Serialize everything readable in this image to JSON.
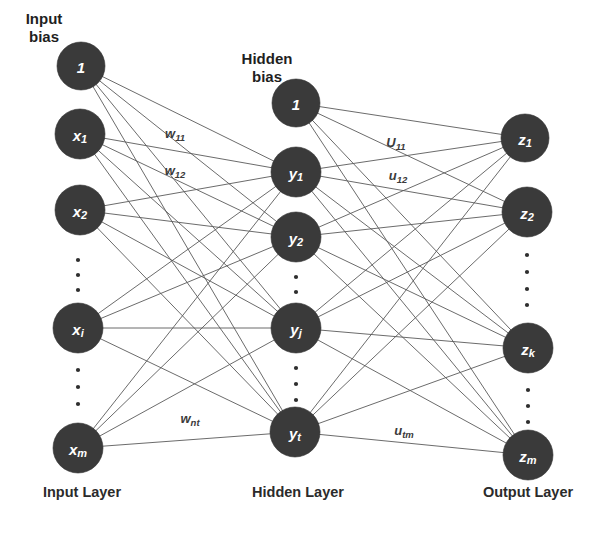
{
  "diagram": {
    "colors": {
      "node_fill": "#3a3a3a",
      "node_text": "#ffffff",
      "edge": "#5a5a5a",
      "label_text": "#2b2b2b",
      "background": "#ffffff"
    },
    "captions": {
      "input_bias": "Input\nbias",
      "input_bias_line1": "Input",
      "input_bias_line2": "bias",
      "hidden_bias_line1": "Hidden",
      "hidden_bias_line2": "bias",
      "input_layer": "Input Layer",
      "hidden_layer": "Hidden Layer",
      "output_layer": "Output Layer"
    },
    "layers": [
      {
        "id": "input",
        "name": "Input Layer",
        "x": 80,
        "nodes": [
          {
            "id": "input-bias",
            "base": "1",
            "sub": "",
            "cx": 81,
            "cy": 66,
            "r": 24,
            "font": 15,
            "is_bias": true
          },
          {
            "id": "input-x1",
            "base": "x",
            "sub": "1",
            "cx": 80,
            "cy": 134,
            "r": 25,
            "font": 15,
            "is_bias": false
          },
          {
            "id": "input-x2",
            "base": "x",
            "sub": "2",
            "cx": 80,
            "cy": 210,
            "r": 25,
            "font": 15,
            "is_bias": false
          },
          {
            "id": "input-xi",
            "base": "x",
            "sub": "i",
            "cx": 78,
            "cy": 328,
            "r": 25,
            "font": 15,
            "is_bias": false
          },
          {
            "id": "input-xm",
            "base": "x",
            "sub": "m",
            "cx": 78,
            "cy": 448,
            "r": 25,
            "font": 15,
            "is_bias": false
          }
        ],
        "ellipses": [
          {
            "cx": 78,
            "cy": 260
          },
          {
            "cx": 78,
            "cy": 275
          },
          {
            "cx": 78,
            "cy": 290
          },
          {
            "cx": 78,
            "cy": 370
          },
          {
            "cx": 78,
            "cy": 387
          },
          {
            "cx": 78,
            "cy": 404
          }
        ]
      },
      {
        "id": "hidden",
        "name": "Hidden Layer",
        "x": 296,
        "nodes": [
          {
            "id": "hidden-bias",
            "base": "1",
            "sub": "",
            "cx": 296,
            "cy": 103,
            "r": 24,
            "font": 15,
            "is_bias": true
          },
          {
            "id": "hidden-y1",
            "base": "y",
            "sub": "1",
            "cx": 296,
            "cy": 172,
            "r": 25,
            "font": 15,
            "is_bias": false
          },
          {
            "id": "hidden-y2",
            "base": "y",
            "sub": "2",
            "cx": 296,
            "cy": 237,
            "r": 25,
            "font": 15,
            "is_bias": false
          },
          {
            "id": "hidden-yj",
            "base": "y",
            "sub": "j",
            "cx": 296,
            "cy": 328,
            "r": 25,
            "font": 15,
            "is_bias": false
          },
          {
            "id": "hidden-yt",
            "base": "y",
            "sub": "t",
            "cx": 295,
            "cy": 432,
            "r": 25,
            "font": 15,
            "is_bias": false
          }
        ],
        "ellipses": [
          {
            "cx": 296,
            "cy": 277
          },
          {
            "cx": 296,
            "cy": 292
          },
          {
            "cx": 296,
            "cy": 368
          },
          {
            "cx": 296,
            "cy": 384
          },
          {
            "cx": 296,
            "cy": 400
          }
        ]
      },
      {
        "id": "output",
        "name": "Output Layer",
        "x": 527,
        "nodes": [
          {
            "id": "output-z1",
            "base": "z",
            "sub": "1",
            "cx": 525,
            "cy": 138,
            "r": 24,
            "font": 15,
            "is_bias": false
          },
          {
            "id": "output-z2",
            "base": "z",
            "sub": "2",
            "cx": 527,
            "cy": 212,
            "r": 25,
            "font": 15,
            "is_bias": false
          },
          {
            "id": "output-zk",
            "base": "z",
            "sub": "k",
            "cx": 528,
            "cy": 348,
            "r": 25,
            "font": 15,
            "is_bias": false
          },
          {
            "id": "output-zm",
            "base": "z",
            "sub": "m",
            "cx": 528,
            "cy": 455,
            "r": 25,
            "font": 15,
            "is_bias": false
          }
        ],
        "ellipses": [
          {
            "cx": 527,
            "cy": 255
          },
          {
            "cx": 527,
            "cy": 272
          },
          {
            "cx": 527,
            "cy": 289
          },
          {
            "cx": 527,
            "cy": 305
          },
          {
            "cx": 528,
            "cy": 390
          },
          {
            "cx": 528,
            "cy": 406
          },
          {
            "cx": 528,
            "cy": 422
          }
        ]
      }
    ],
    "weight_labels": [
      {
        "id": "w11",
        "base": "w",
        "sub": "11",
        "x": 175,
        "y": 133
      },
      {
        "id": "w12",
        "base": "w",
        "sub": "12",
        "x": 175,
        "y": 170
      },
      {
        "id": "wnt",
        "base": "w",
        "sub": "nt",
        "x": 190,
        "y": 418
      },
      {
        "id": "U11",
        "base": "U",
        "sub": "11",
        "x": 396,
        "y": 142
      },
      {
        "id": "u12",
        "base": "u",
        "sub": "12",
        "x": 398,
        "y": 175
      },
      {
        "id": "utm",
        "base": "u",
        "sub": "tm",
        "x": 404,
        "y": 430
      }
    ],
    "captions_positions": {
      "input_bias": {
        "x": 44,
        "y1": 18,
        "y2": 36
      },
      "hidden_bias": {
        "x": 267,
        "y1": 58,
        "y2": 76
      },
      "input_layer": {
        "x": 82,
        "y": 492
      },
      "hidden_layer": {
        "x": 298,
        "y": 492
      },
      "output_layer": {
        "x": 528,
        "y": 492
      }
    }
  }
}
